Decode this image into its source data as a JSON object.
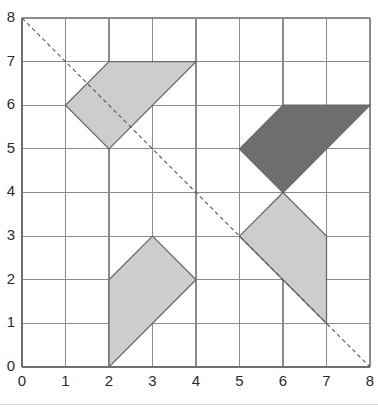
{
  "figure": {
    "background_color": "#ffffff"
  },
  "chart_data": {
    "type": "scatter",
    "title": "",
    "subtitle": "",
    "xlabel": "",
    "ylabel": "",
    "xlim": [
      0,
      8
    ],
    "ylim": [
      0,
      8
    ],
    "grid": true,
    "grid_spacing": 1,
    "grid_color": "#8c8c8c",
    "axis_color": "#6f6f6f",
    "legend": null,
    "x_tick_labels": [
      "0",
      "1",
      "2",
      "3",
      "4",
      "5",
      "6",
      "7",
      "8"
    ],
    "y_tick_labels": [
      "0",
      "1",
      "2",
      "3",
      "4",
      "5",
      "6",
      "7",
      "8"
    ],
    "x_ticks": [
      0,
      1,
      2,
      3,
      4,
      5,
      6,
      7,
      8
    ],
    "y_ticks": [
      0,
      1,
      2,
      3,
      4,
      5,
      6,
      7,
      8
    ],
    "annotations": [
      {
        "name": "mirror-line",
        "type": "line",
        "style": "dashed",
        "color": "#555555",
        "from": [
          0,
          8
        ],
        "to": [
          8,
          0
        ]
      }
    ],
    "shapes": [
      {
        "name": "top-left-quadrilateral",
        "type": "polygon",
        "fill": "#cdcdcd",
        "stroke": "#6a6a6a",
        "vertices": [
          [
            1,
            6
          ],
          [
            2,
            7
          ],
          [
            4,
            7
          ],
          [
            2,
            5
          ]
        ]
      },
      {
        "name": "bottom-middle-quadrilateral",
        "type": "polygon",
        "fill": "#cdcdcd",
        "stroke": "#6a6a6a",
        "vertices": [
          [
            2,
            2
          ],
          [
            3,
            3
          ],
          [
            4,
            2
          ],
          [
            2,
            0
          ]
        ]
      },
      {
        "name": "top-right-dark-quadrilateral",
        "type": "polygon",
        "fill": "#6e6e6e",
        "stroke": "#5a5a5a",
        "vertices": [
          [
            5,
            5
          ],
          [
            6,
            6
          ],
          [
            8,
            6
          ],
          [
            6,
            4
          ]
        ]
      },
      {
        "name": "bottom-right-quadrilateral",
        "type": "polygon",
        "fill": "#cdcdcd",
        "stroke": "#6a6a6a",
        "vertices": [
          [
            6,
            4
          ],
          [
            7,
            3
          ],
          [
            7,
            1
          ],
          [
            5,
            3
          ]
        ]
      }
    ]
  },
  "colors": {
    "light_fill": "#cdcdcd",
    "dark_fill": "#6e6e6e",
    "shape_stroke": "#6a6a6a",
    "grid": "#8c8c8c",
    "axis": "#6f6f6f",
    "dashed_line": "#555555",
    "label_text": "#2b2b2b",
    "footer_rule": "#d9d9d9"
  },
  "geometry": {
    "plot_left_px": 22,
    "plot_top_px": 18,
    "plot_right_px": 370,
    "plot_bottom_px": 367
  }
}
